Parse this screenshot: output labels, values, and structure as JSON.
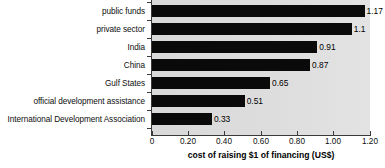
{
  "chart_data": {
    "type": "bar",
    "orientation": "horizontal",
    "title": "",
    "xlabel": "cost of raising $1 of financing (US$)",
    "ylabel": "",
    "categories": [
      "public funds",
      "private sector",
      "India",
      "China",
      "Gulf States",
      "official development assistance",
      "International Development Association"
    ],
    "values": [
      1.17,
      1.1,
      0.91,
      0.87,
      0.65,
      0.51,
      0.33
    ],
    "value_labels": [
      "1.17",
      "1.1",
      "0.91",
      "0.87",
      "0.65",
      "0.51",
      "0.33"
    ],
    "xlim": [
      0,
      1.2
    ],
    "xticks": [
      0,
      0.2,
      0.4,
      0.6,
      0.8,
      1.0,
      1.2
    ],
    "xtick_labels": [
      "0",
      "0.20",
      "0.40",
      "0.60",
      "0.80",
      "1.00",
      "1.20"
    ],
    "grid": false,
    "legend": null,
    "bar_color": "#0a0a0a",
    "plot_background": "#dcdcdc",
    "page_background": "#ffffff"
  }
}
